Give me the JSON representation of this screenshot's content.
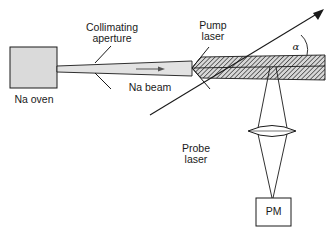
{
  "diagram": {
    "labels": {
      "oven": "Na oven",
      "aperture_line1": "Collimating",
      "aperture_line2": "aperture",
      "beam": "Na beam",
      "pump_line1": "Pump",
      "pump_line2": "laser",
      "probe_line1": "Probe",
      "probe_line2": "laser",
      "detector": "PM",
      "angle": "α"
    },
    "colors": {
      "oven_fill": "#dadada",
      "beam_fill": "#e2e2e2",
      "hatch_fill": "#8a8a8a",
      "line": "#1a1a1a"
    }
  }
}
